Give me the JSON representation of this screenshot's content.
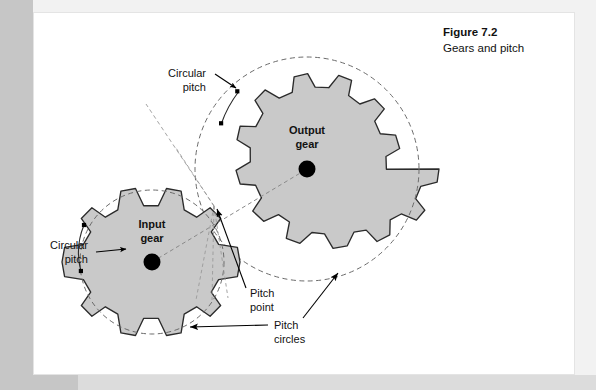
{
  "page": {
    "background_color": "#ffffff",
    "surround_color": "#c6c6c6"
  },
  "caption": {
    "title": "Figure 7.2",
    "subtitle": "Gears and pitch"
  },
  "labels": {
    "circular_pitch_top_line1": "Circular",
    "circular_pitch_top_line2": "pitch",
    "circular_pitch_left_line1": "Circular",
    "circular_pitch_left_line2": "pitch",
    "output_gear_line1": "Output",
    "output_gear_line2": "gear",
    "input_gear_line1": "Input",
    "input_gear_line2": "gear",
    "pitch_point_line1": "Pitch",
    "pitch_point_line2": "point",
    "pitch_circles_line1": "Pitch",
    "pitch_circles_line2": "circles"
  },
  "diagram": {
    "type": "gear-mesh",
    "gear_fill_color": "#c9c9c9",
    "gear_outline_color": "#2b2b2b",
    "pitch_circle_style": "dashed",
    "pitch_circle_color": "#6b6b6b",
    "center_dot_color": "#000000",
    "input_gear": {
      "teeth": 8,
      "center_x": 152,
      "center_y": 262,
      "pitch_radius": 72,
      "outer_radius": 88,
      "root_radius": 62
    },
    "output_gear": {
      "teeth": 12,
      "center_x": 307,
      "center_y": 169,
      "pitch_radius": 112,
      "outer_radius": 133,
      "root_radius": 98
    },
    "pitch_point": {
      "x": 214,
      "y": 206
    }
  }
}
